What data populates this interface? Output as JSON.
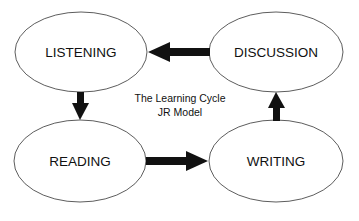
{
  "diagram": {
    "title_line1": "The Learning Cycle",
    "title_line2": "JR Model",
    "colors": {
      "stroke": "#333333",
      "arrow": "#111111",
      "background": "#ffffff"
    },
    "nodes": [
      {
        "id": "listening",
        "label": "LISTENING"
      },
      {
        "id": "discussion",
        "label": "DISCUSSION"
      },
      {
        "id": "reading",
        "label": "READING"
      },
      {
        "id": "writing",
        "label": "WRITING"
      }
    ],
    "edges": [
      {
        "from": "listening",
        "to": "reading"
      },
      {
        "from": "reading",
        "to": "writing"
      },
      {
        "from": "writing",
        "to": "discussion"
      },
      {
        "from": "discussion",
        "to": "listening"
      }
    ]
  }
}
